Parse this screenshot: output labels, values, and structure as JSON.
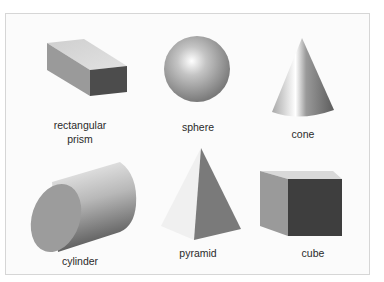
{
  "shapes": [
    {
      "id": "rectangular-prism",
      "label": "rectangular\nprism"
    },
    {
      "id": "sphere",
      "label": "sphere"
    },
    {
      "id": "cone",
      "label": "cone"
    },
    {
      "id": "cylinder",
      "label": "cylinder"
    },
    {
      "id": "pyramid",
      "label": "pyramid"
    },
    {
      "id": "cube",
      "label": "cube"
    }
  ],
  "colors": {
    "frame_border": "#d6d6d6",
    "background": "#fbfbfb",
    "dark_face": "#4a4a4a",
    "mid_face": "#8c8c8c",
    "light_face": "#d8d8d8"
  }
}
